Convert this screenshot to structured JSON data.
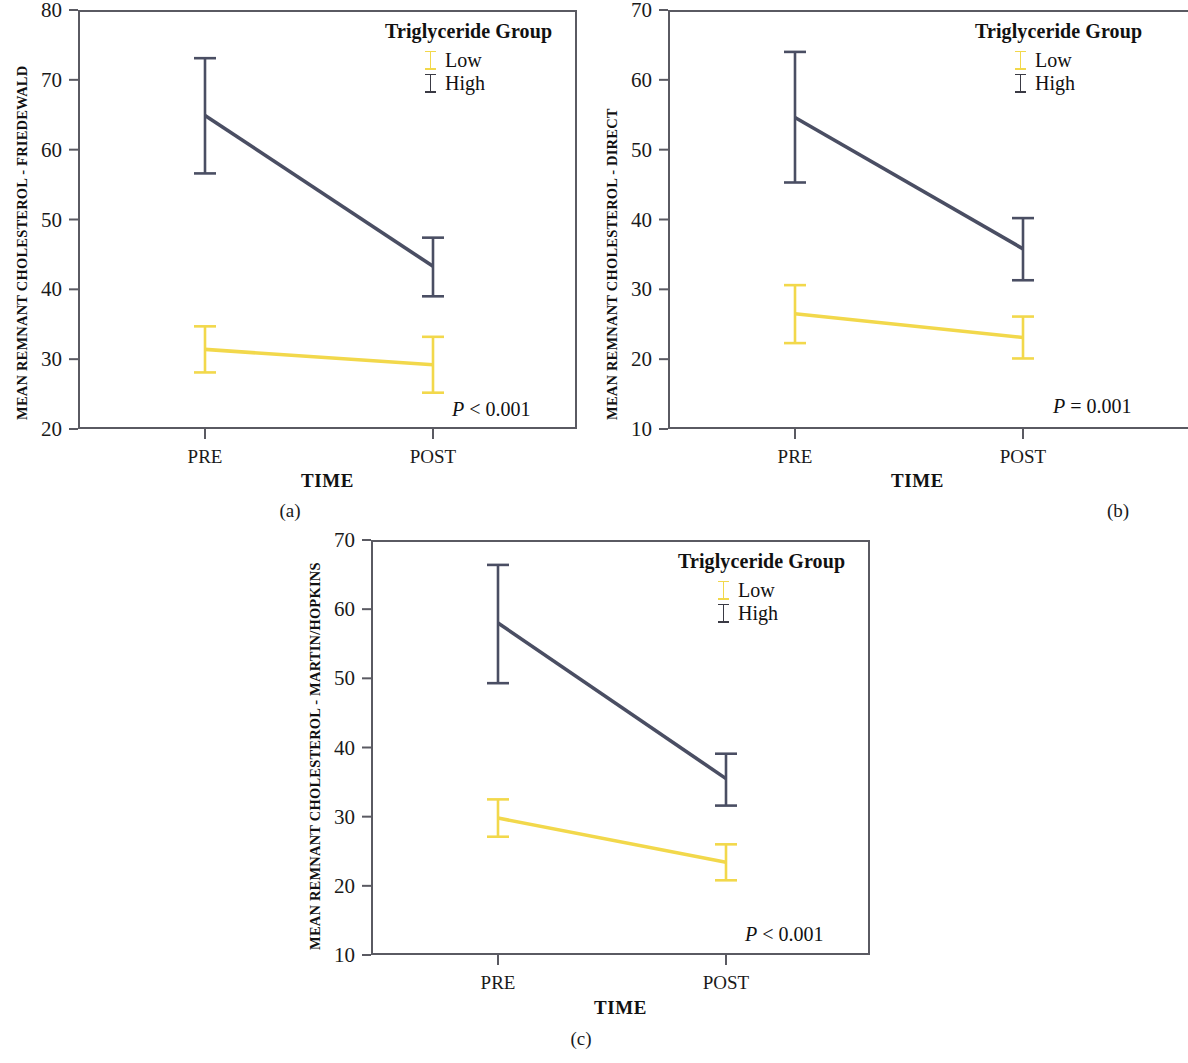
{
  "figure": {
    "background": "#ffffff",
    "series_colors": {
      "low": "#f2d84b",
      "high": "#4a4e63"
    },
    "axis_color": "#5a5a62"
  },
  "panels": [
    {
      "caption": "(a)",
      "legend_title": "Triglyceride Group",
      "legend_items": [
        {
          "label": "Low",
          "color": "#f2d84b"
        },
        {
          "label": "High",
          "color": "#4a4e63"
        }
      ],
      "pvalue_prefix": "P",
      "pvalue_text": " < 0.001",
      "chart_data": {
        "type": "line",
        "title": "",
        "xlabel": "TIME",
        "ylabel": "MEAN REMNANT CHOLESTEROL - FRIEDEWALD",
        "categories": [
          "PRE",
          "POST"
        ],
        "x_tick_labels": [
          "PRE",
          "POST"
        ],
        "y_tick_labels": [
          "20",
          "30",
          "40",
          "50",
          "60",
          "70",
          "80"
        ],
        "y_ticks": [
          20,
          30,
          40,
          50,
          60,
          70,
          80
        ],
        "ylim": [
          20,
          80
        ],
        "grid": false,
        "legend_position": "top-right",
        "error_bar_type": "95% CI",
        "series": [
          {
            "name": "Low",
            "color": "#f2d84b",
            "values": [
              31.4,
              29.2
            ],
            "error_low": [
              28.1,
              25.2
            ],
            "error_high": [
              34.7,
              33.2
            ]
          },
          {
            "name": "High",
            "color": "#4a4e63",
            "values": [
              64.9,
              43.3
            ],
            "error_low": [
              56.6,
              39.0
            ],
            "error_high": [
              73.1,
              47.4
            ]
          }
        ]
      }
    },
    {
      "caption": "(b)",
      "legend_title": "Triglyceride Group",
      "legend_items": [
        {
          "label": "Low",
          "color": "#f2d84b"
        },
        {
          "label": "High",
          "color": "#4a4e63"
        }
      ],
      "pvalue_prefix": "P",
      "pvalue_text": " = 0.001",
      "chart_data": {
        "type": "line",
        "title": "",
        "xlabel": "TIME",
        "ylabel": "MEAN REMNANT CHOLESTEROL - DIRECT",
        "categories": [
          "PRE",
          "POST"
        ],
        "x_tick_labels": [
          "PRE",
          "POST"
        ],
        "y_tick_labels": [
          "10",
          "20",
          "30",
          "40",
          "50",
          "60",
          "70"
        ],
        "y_ticks": [
          10,
          20,
          30,
          40,
          50,
          60,
          70
        ],
        "ylim": [
          10,
          70
        ],
        "grid": false,
        "legend_position": "top-right",
        "error_bar_type": "95% CI",
        "series": [
          {
            "name": "Low",
            "color": "#f2d84b",
            "values": [
              26.5,
              23.1
            ],
            "error_low": [
              22.3,
              20.1
            ],
            "error_high": [
              30.6,
              26.1
            ]
          },
          {
            "name": "High",
            "color": "#4a4e63",
            "values": [
              54.6,
              35.8
            ],
            "error_low": [
              45.3,
              31.3
            ],
            "error_high": [
              64.0,
              40.2
            ]
          }
        ]
      }
    },
    {
      "caption": "(c)",
      "legend_title": "Triglyceride Group",
      "legend_items": [
        {
          "label": "Low",
          "color": "#f2d84b"
        },
        {
          "label": "High",
          "color": "#4a4e63"
        }
      ],
      "pvalue_prefix": "P",
      "pvalue_text": " < 0.001",
      "chart_data": {
        "type": "line",
        "title": "",
        "xlabel": "TIME",
        "ylabel": "MEAN REMNANT CHOLESTEROL - MARTIN/HOPKINS",
        "categories": [
          "PRE",
          "POST"
        ],
        "x_tick_labels": [
          "PRE",
          "POST"
        ],
        "y_tick_labels": [
          "10",
          "20",
          "30",
          "40",
          "50",
          "60",
          "70"
        ],
        "y_ticks": [
          10,
          20,
          30,
          40,
          50,
          60,
          70
        ],
        "ylim": [
          10,
          70
        ],
        "grid": false,
        "legend_position": "top-right",
        "error_bar_type": "95% CI",
        "series": [
          {
            "name": "Low",
            "color": "#f2d84b",
            "values": [
              29.8,
              23.4
            ],
            "error_low": [
              27.1,
              20.8
            ],
            "error_high": [
              32.5,
              26.0
            ]
          },
          {
            "name": "High",
            "color": "#4a4e63",
            "values": [
              58.0,
              35.5
            ],
            "error_low": [
              49.3,
              31.6
            ],
            "error_high": [
              66.4,
              39.1
            ]
          }
        ]
      }
    }
  ]
}
